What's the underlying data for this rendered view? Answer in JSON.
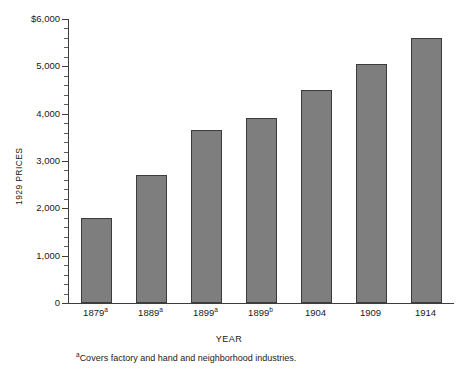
{
  "chart_data": {
    "type": "bar",
    "title": "",
    "xlabel": "YEAR",
    "ylabel": "1929 PRICES",
    "categories": [
      "1879a",
      "1889a",
      "1899a",
      "1899b",
      "1904",
      "1909",
      "1914"
    ],
    "category_labels": [
      {
        "text": "1879",
        "sup": "a"
      },
      {
        "text": "1889",
        "sup": "a"
      },
      {
        "text": "1899",
        "sup": "a"
      },
      {
        "text": "1899",
        "sup": "b"
      },
      {
        "text": "1904",
        "sup": ""
      },
      {
        "text": "1909",
        "sup": ""
      },
      {
        "text": "1914",
        "sup": ""
      }
    ],
    "values": [
      1800,
      2700,
      3650,
      3900,
      4500,
      5050,
      5600
    ],
    "ylim": [
      0,
      6000
    ],
    "ytick_values": [
      0,
      1000,
      2000,
      3000,
      4000,
      5000,
      6000
    ],
    "ytick_labels": [
      "0",
      "1,000",
      "2,000",
      "3,000",
      "4,000",
      "5,000",
      "$6,000"
    ],
    "minor_tick_interval": 200,
    "grid": false,
    "legend": null,
    "bar_color": "#7e7e7e",
    "bar_edge_color": "#3c3c3c",
    "axis_color": "#3d3d3d"
  },
  "footnote": {
    "marker": "a",
    "text": "Covers factory and hand and neighborhood industries."
  }
}
